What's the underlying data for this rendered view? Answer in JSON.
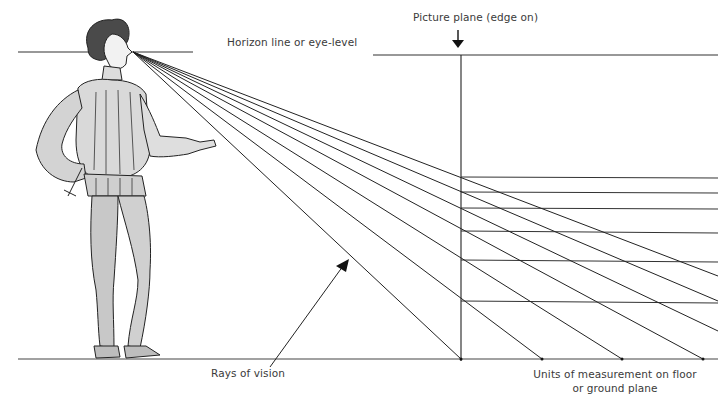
{
  "diagram": {
    "type": "perspective-construction",
    "labels": {
      "horizon": "Horizon line or eye-level",
      "picture_plane": "Picture plane (edge on)",
      "rays": "Rays of vision",
      "units_line1": "Units of measurement on floor",
      "units_line2": "or ground plane"
    },
    "figure": "Renaissance man standing, pointing toward picture plane",
    "eye_point": [
      133,
      52
    ],
    "horizon_y": 53,
    "ground_y": 359,
    "picture_plane_x": 461,
    "ground_unit_marks_x": [
      461,
      542,
      622,
      703
    ],
    "picture_plane_intersections_y": [
      177,
      192,
      208,
      231,
      260,
      301
    ],
    "colors": {
      "line": "#2a2a2a",
      "text": "#3a3a3a",
      "background": "#ffffff"
    }
  }
}
